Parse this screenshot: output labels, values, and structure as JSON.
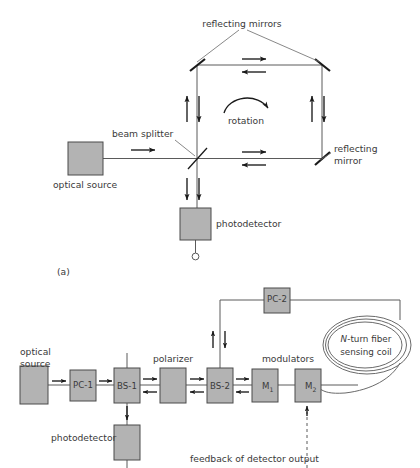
{
  "figure": {
    "type": "optical-interferometer-diagram",
    "panel_a_caption": "(a)",
    "colors": {
      "component_fill": "#b3b3b3",
      "component_stroke": "#4a4a4a",
      "beam_line": "#5a5a5a",
      "mirror": "#1a1a1a",
      "text": "#3a3a3a",
      "background": "#ffffff"
    }
  },
  "panel_a": {
    "name": "Sagnac ring interferometer",
    "labels": {
      "reflecting_mirrors": "reflecting mirrors",
      "reflecting_mirror": "reflecting\nmirror",
      "reflecting_mirror_line1": "reflecting",
      "reflecting_mirror_line2": "mirror",
      "rotation": "rotation",
      "beam_splitter": "beam splitter",
      "optical_source": "optical source",
      "photodetector": "photodetector"
    },
    "components": [
      {
        "id": "optical-source",
        "label": "optical source",
        "shape": "box"
      },
      {
        "id": "beam-splitter",
        "label": "beam splitter",
        "shape": "diagonal-line"
      },
      {
        "id": "mirror-top-left",
        "label": "reflecting mirror",
        "shape": "diagonal-line"
      },
      {
        "id": "mirror-top-right",
        "label": "reflecting mirror",
        "shape": "diagonal-line"
      },
      {
        "id": "mirror-bottom-right",
        "label": "reflecting mirror",
        "shape": "diagonal-line"
      },
      {
        "id": "photodetector",
        "label": "photodetector",
        "shape": "box"
      }
    ],
    "beam_direction_arrows": [
      {
        "id": "source-to-splitter",
        "direction": "right"
      },
      {
        "id": "top-path-cw",
        "direction": "right"
      },
      {
        "id": "top-path-ccw",
        "direction": "left"
      },
      {
        "id": "bottom-path-cw",
        "direction": "right"
      },
      {
        "id": "bottom-path-ccw",
        "direction": "left"
      },
      {
        "id": "left-leg-up",
        "direction": "up"
      },
      {
        "id": "left-leg-down",
        "direction": "down"
      },
      {
        "id": "right-leg-up",
        "direction": "up"
      },
      {
        "id": "right-leg-down",
        "direction": "down"
      },
      {
        "id": "detector-leg-a",
        "direction": "down"
      },
      {
        "id": "detector-leg-b",
        "direction": "down"
      }
    ],
    "rotation_arrow": {
      "label": "rotation",
      "sense": "clockwise"
    }
  },
  "panel_b": {
    "name": "Fiber optic gyroscope",
    "labels": {
      "optical_source_line1": "optical",
      "optical_source_line2": "source",
      "polarizer": "polarizer",
      "modulators": "modulators",
      "photodetector": "photodetector",
      "sensing_coil_line1_italic": "N",
      "sensing_coil_line1_rest": "-turn fiber",
      "sensing_coil_line2": "sensing coil",
      "feedback": "feedback of detector output"
    },
    "components": [
      {
        "id": "optical-source",
        "label": "",
        "caption": "optical source"
      },
      {
        "id": "pc-1",
        "label": "PC-1",
        "caption": "polarization controller 1"
      },
      {
        "id": "bs-1",
        "label": "BS-1",
        "caption": "beam splitter 1"
      },
      {
        "id": "polarizer",
        "label": "",
        "caption": "polarizer"
      },
      {
        "id": "bs-2",
        "label": "BS-2",
        "caption": "beam splitter 2"
      },
      {
        "id": "m-1",
        "label": "M",
        "sub": "1",
        "caption": "modulator 1"
      },
      {
        "id": "m-2",
        "label": "M",
        "sub": "2",
        "caption": "modulator 2"
      },
      {
        "id": "pc-2",
        "label": "PC-2",
        "caption": "polarization controller 2"
      },
      {
        "id": "photodetector",
        "label": "",
        "caption": "photodetector"
      },
      {
        "id": "sensing-coil",
        "label": "N-turn fiber sensing coil",
        "caption": "N-turn fiber sensing coil"
      }
    ],
    "beam_direction_arrows": [
      {
        "id": "source-to-pc1",
        "direction": "right"
      },
      {
        "id": "pc1-to-bs1",
        "direction": "right"
      },
      {
        "id": "bs1-to-polarizer-fwd",
        "direction": "right"
      },
      {
        "id": "polarizer-to-bs1-rev",
        "direction": "left"
      },
      {
        "id": "polarizer-to-bs2-fwd",
        "direction": "right"
      },
      {
        "id": "bs2-to-polarizer-rev",
        "direction": "left"
      },
      {
        "id": "bs2-to-m1-fwd",
        "direction": "right"
      },
      {
        "id": "m1-to-bs2-rev",
        "direction": "left"
      },
      {
        "id": "bs2-to-pc2-up",
        "direction": "up"
      },
      {
        "id": "pc2-to-bs2-down",
        "direction": "down"
      },
      {
        "id": "bs1-to-photodetector",
        "direction": "down"
      },
      {
        "id": "feedback-to-m2",
        "direction": "up",
        "style": "dashed"
      }
    ]
  }
}
